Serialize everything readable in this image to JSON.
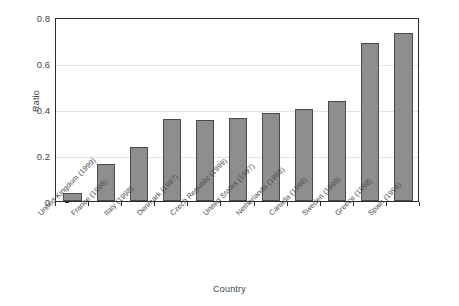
{
  "chart_data": {
    "type": "bar",
    "title": "",
    "xlabel": "Country",
    "ylabel": "Ratio",
    "ylim": [
      0,
      0.8
    ],
    "ytick_labels": [
      "0",
      "0.2",
      "0.4",
      "0.6",
      "0.8"
    ],
    "ytick_values": [
      0,
      0.2,
      0.4,
      0.6,
      0.8
    ],
    "grid": true,
    "legend": false,
    "categories": [
      "United Kingdom (1999)",
      "France (1998)",
      "Italy (1998)",
      "Denmark (1997)",
      "Czech Republic (1999)",
      "United States (1997)",
      "Netherlands (1998)",
      "Canada (1998)",
      "Sweden (1999)",
      "Greece (1998)",
      "Spain (1996)"
    ],
    "values": [
      0.035,
      0.16,
      0.235,
      0.355,
      0.353,
      0.363,
      0.381,
      0.402,
      0.437,
      0.688,
      0.732
    ],
    "bar_color": "#8e8e8e",
    "bar_edge_color": "#4a4a4a",
    "gridline_color": "#e2e2e2",
    "axis_color": "#2b2b2b"
  }
}
